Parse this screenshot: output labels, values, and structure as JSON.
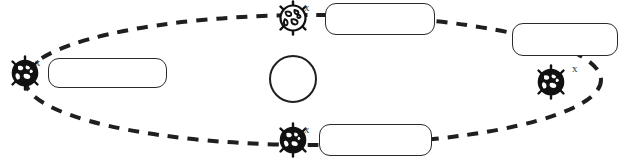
{
  "diagram": {
    "canvas": {
      "width": 625,
      "height": 165,
      "background": "#ffffff"
    },
    "colors": {
      "stroke": "#1f1f1f",
      "box_border": "#2b2b2b",
      "box_fill": "#ffffff",
      "globe_dark": "#111111",
      "globe_light": "#ffffff",
      "x_label": "#3a3a3a"
    },
    "orbit": {
      "shape": "ellipse",
      "style": "dashed",
      "center_x": 313,
      "center_y": 80,
      "radius_x": 288,
      "radius_y": 65,
      "dash": "11 9",
      "stroke_width": 4
    },
    "sun": {
      "name": "sun",
      "label": "",
      "cx": 293,
      "cy": 79,
      "r": 24
    },
    "globes": [
      {
        "id": "globe-left",
        "position": "left",
        "shade": "dark",
        "cx": 25,
        "cy": 73,
        "r": 14,
        "x_label": "x",
        "x_left": 35,
        "x_top": 57
      },
      {
        "id": "globe-top",
        "position": "top",
        "shade": "light",
        "cx": 293,
        "cy": 18,
        "r": 14,
        "x_label": "x",
        "x_left": 304,
        "x_top": 2
      },
      {
        "id": "globe-bottom",
        "position": "bottom",
        "shade": "dark",
        "cx": 293,
        "cy": 140,
        "r": 14,
        "x_label": "x",
        "x_left": 304,
        "x_top": 124
      },
      {
        "id": "globe-right",
        "position": "right",
        "shade": "dark",
        "cx": 551,
        "cy": 82,
        "r": 14,
        "x_label": "x",
        "x_left": 572,
        "x_top": 63
      }
    ],
    "label_boxes": [
      {
        "id": "label-box-left",
        "text": "",
        "left": 48,
        "top": 58,
        "width": 119,
        "height": 30
      },
      {
        "id": "label-box-top",
        "text": "",
        "left": 325,
        "top": 3,
        "width": 110,
        "height": 32
      },
      {
        "id": "label-box-right",
        "text": "",
        "left": 512,
        "top": 23,
        "width": 106,
        "height": 33
      },
      {
        "id": "label-box-bottom",
        "text": "",
        "left": 319,
        "top": 124,
        "width": 113,
        "height": 32
      }
    ]
  }
}
